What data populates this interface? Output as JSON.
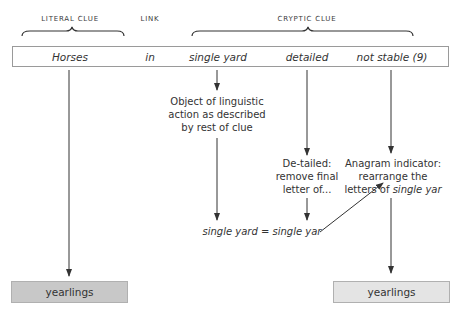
{
  "headers": {
    "literal": "LITERAL CLUE",
    "link": "LINK",
    "cryptic": "CRYPTIC CLUE"
  },
  "clue": {
    "words": [
      {
        "text": "Horses",
        "role": "literal"
      },
      {
        "text": "in",
        "role": "link"
      },
      {
        "text": "single yard",
        "role": "cryptic"
      },
      {
        "text": "detailed",
        "role": "cryptic"
      },
      {
        "text": "not stable (9)",
        "role": "cryptic"
      }
    ]
  },
  "notes": {
    "object": [
      "Object of linguistic",
      "action as described",
      "by rest of clue"
    ],
    "detailed": [
      "De-tailed:",
      "remove final",
      "letter of..."
    ],
    "anagram_line1": "Anagram indicator:",
    "anagram_line2": "rearrange the",
    "anagram_line3_prefix": "letters of ",
    "anagram_line3_italic": "single yar",
    "equation": "single yard = single yar"
  },
  "results": {
    "left": {
      "text": "yearlings",
      "fill": "#c8c8c8"
    },
    "right": {
      "text": "yearlings",
      "fill": "#e4e4e4"
    }
  },
  "colors": {
    "line": "#333333",
    "box_border": "#9a9a9a"
  }
}
